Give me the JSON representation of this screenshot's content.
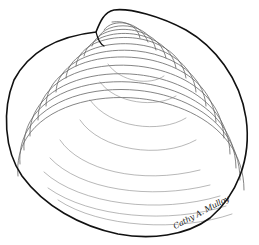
{
  "artwork": {
    "subject": "clam shell line drawing",
    "signature": "Cathy A. Mulloy",
    "colors": {
      "background": "#ffffff",
      "ink": "#1a1a1a",
      "growth_lines": "#555555"
    }
  }
}
